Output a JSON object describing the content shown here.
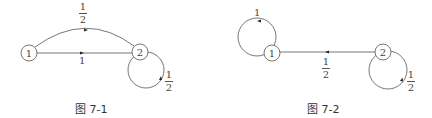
{
  "figures": [
    {
      "caption": "图 7-1",
      "nodes": [
        {
          "id": "1",
          "label": "1"
        },
        {
          "id": "2",
          "label": "2"
        }
      ],
      "edges": [
        {
          "from": "2",
          "to": "1",
          "shape": "arc-top",
          "weight": "1/2",
          "num": "1",
          "den": "2"
        },
        {
          "from": "1",
          "to": "2",
          "shape": "straight",
          "weight": "1",
          "label": "1"
        },
        {
          "from": "2",
          "to": "2",
          "shape": "self-loop",
          "weight": "1/2",
          "num": "1",
          "den": "2"
        }
      ]
    },
    {
      "caption": "图 7-2",
      "nodes": [
        {
          "id": "1",
          "label": "1"
        },
        {
          "id": "2",
          "label": "2"
        }
      ],
      "edges": [
        {
          "from": "1",
          "to": "1",
          "shape": "self-loop",
          "weight": "1",
          "label": "1"
        },
        {
          "from": "2",
          "to": "1",
          "shape": "straight",
          "weight": "1/2",
          "num": "1",
          "den": "2"
        },
        {
          "from": "2",
          "to": "2",
          "shape": "self-loop",
          "weight": "1/2",
          "num": "1",
          "den": "2"
        }
      ]
    }
  ],
  "colors": {
    "line": "#555555",
    "text": "#333333",
    "background": "#ffffff"
  }
}
